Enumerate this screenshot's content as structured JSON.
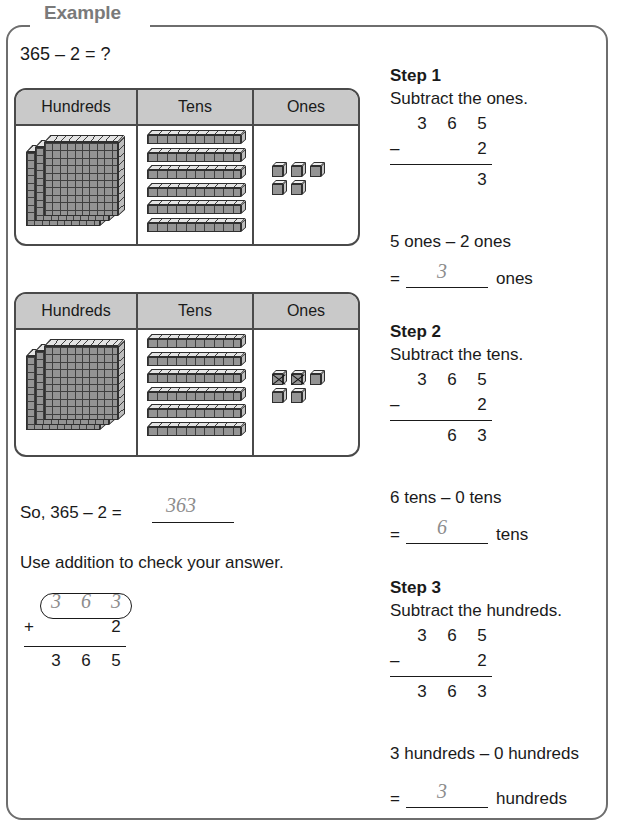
{
  "frame": {
    "label": "Example"
  },
  "problem": {
    "statement": "365 – 2 = ?"
  },
  "tables": [
    {
      "name": "place-value-before",
      "headers": [
        "Hundreds",
        "Tens",
        "Ones"
      ],
      "hundreds_flats": 3,
      "tens_rods": 6,
      "ones_cubes": 5,
      "ones_crossed": 0
    },
    {
      "name": "place-value-after",
      "headers": [
        "Hundreds",
        "Tens",
        "Ones"
      ],
      "hundreds_flats": 3,
      "tens_rods": 6,
      "ones_cubes": 5,
      "ones_crossed": 2
    }
  ],
  "conclusion": {
    "prefix": "So, 365 – 2 =",
    "answer": "363"
  },
  "check": {
    "instruction": "Use addition to check your answer.",
    "addend_top": [
      "3",
      "6",
      "3"
    ],
    "operator": "+",
    "addend_bottom": "2",
    "sum": [
      "3",
      "6",
      "5"
    ]
  },
  "steps": [
    {
      "title": "Step 1",
      "instruction": "Subtract the ones.",
      "minuend": [
        "3",
        "6",
        "5"
      ],
      "operator": "–",
      "subtrahend_ones": "2",
      "result": [
        "",
        "",
        "3"
      ],
      "sentence": "5 ones – 2 ones",
      "equals": "=",
      "value": "3",
      "unit": "ones"
    },
    {
      "title": "Step 2",
      "instruction": "Subtract the tens.",
      "minuend": [
        "3",
        "6",
        "5"
      ],
      "operator": "–",
      "subtrahend_ones": "2",
      "result": [
        "",
        "6",
        "3"
      ],
      "sentence": "6 tens – 0 tens",
      "equals": "=",
      "value": "6",
      "unit": "tens"
    },
    {
      "title": "Step 3",
      "instruction": "Subtract the hundreds.",
      "minuend": [
        "3",
        "6",
        "5"
      ],
      "operator": "–",
      "subtrahend_ones": "2",
      "result": [
        "3",
        "6",
        "3"
      ],
      "sentence": "3 hundreds – 0 hundreds",
      "equals": "=",
      "value": "3",
      "unit": "hundreds"
    }
  ]
}
